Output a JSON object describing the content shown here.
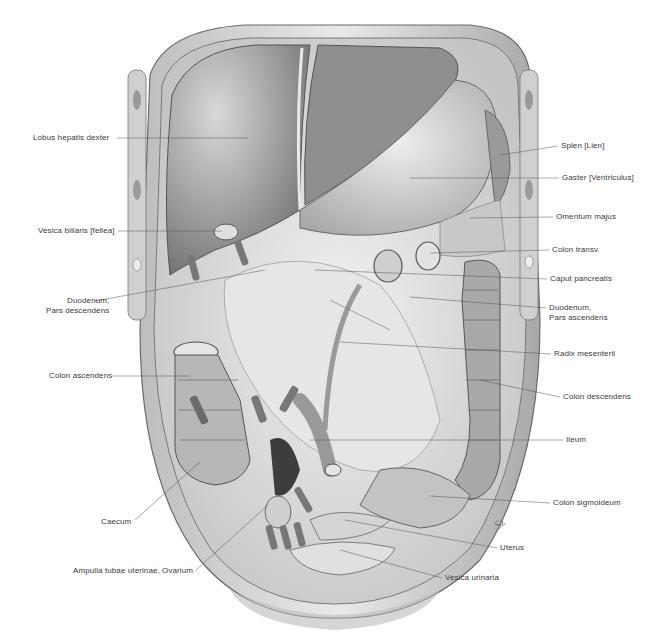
{
  "figure": {
    "colors": {
      "background": "#ffffff",
      "ink": "#3a3a3a",
      "organ_dark": "#7a7a7a",
      "organ_mid": "#a8a8a8",
      "organ_light": "#d6d6d6",
      "wall": "#cfcfcf"
    },
    "labels_left": [
      {
        "id": "lobus-hepatis-dexter",
        "text": "Lobus hepatis dexter",
        "x": 33,
        "y": 133,
        "tx": 248,
        "ty": 138
      },
      {
        "id": "vesica-biliaris",
        "text": "Vesica biliaris [fellea]",
        "x": 38,
        "y": 227,
        "tx": 222,
        "ty": 231
      },
      {
        "id": "duodenum-pars-descendens",
        "lines": [
          "Duodenum,",
          "Pars descendens"
        ],
        "x": 46,
        "y": 298,
        "tx": 265,
        "ty": 270
      },
      {
        "id": "colon-ascendens",
        "text": "Colon ascendens",
        "x": 49,
        "y": 372,
        "tx": 190,
        "ty": 376
      },
      {
        "id": "caecum",
        "text": "Caecum",
        "x": 101,
        "y": 517,
        "tx": 200,
        "ty": 462
      },
      {
        "id": "ampulla-tubae",
        "text": "Ampulla tubae uterinae, Ovarium",
        "x": 73,
        "y": 568,
        "tx": 268,
        "ty": 505
      }
    ],
    "labels_right": [
      {
        "id": "splen",
        "text": "Splen [Lien]",
        "x": 561,
        "y": 143,
        "tx": 500,
        "ty": 155
      },
      {
        "id": "gaster",
        "text": "Gaster [Ventriculus]",
        "x": 562,
        "y": 175,
        "tx": 410,
        "ty": 178
      },
      {
        "id": "omentum-majus",
        "text": "Omentum majus",
        "x": 556,
        "y": 214,
        "tx": 470,
        "ty": 218
      },
      {
        "id": "colon-transv",
        "text": "Colon transv.",
        "x": 552,
        "y": 247,
        "tx": 430,
        "ty": 253
      },
      {
        "id": "caput-pancreatis",
        "text": "Caput pancreatis",
        "x": 550,
        "y": 276,
        "tx": 315,
        "ty": 270
      },
      {
        "id": "duodenum-pars-ascendens",
        "lines": [
          "Duodenum,",
          "Pars ascendens"
        ],
        "x": 549,
        "y": 305,
        "tx": 410,
        "ty": 297
      },
      {
        "id": "radix-mesenterii",
        "text": "Radix mesenterii",
        "x": 554,
        "y": 351,
        "tx": 340,
        "ty": 342
      },
      {
        "id": "colon-descendens",
        "text": "Colon descendens",
        "x": 563,
        "y": 394,
        "tx": 480,
        "ty": 380
      },
      {
        "id": "ileum",
        "text": "Ileum",
        "x": 566,
        "y": 437,
        "tx": 310,
        "ty": 440
      },
      {
        "id": "colon-sigmoideum",
        "text": "Colon sigmoideum",
        "x": 553,
        "y": 500,
        "tx": 430,
        "ty": 496
      },
      {
        "id": "uterus",
        "text": "Uterus",
        "x": 500,
        "y": 545,
        "tx": 345,
        "ty": 520
      },
      {
        "id": "vesica-urinaria",
        "text": "Vesica urinaria",
        "x": 445,
        "y": 575,
        "tx": 340,
        "ty": 550
      }
    ],
    "signature": "Sz"
  }
}
